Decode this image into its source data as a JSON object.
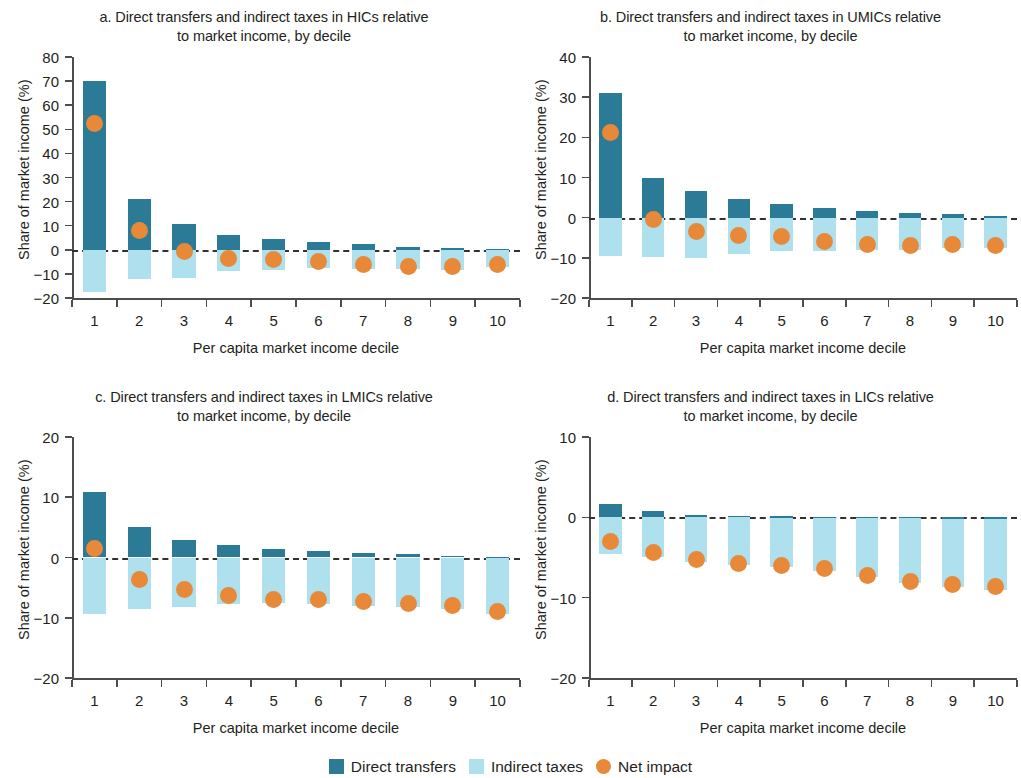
{
  "figure": {
    "x_axis_title": "Per capita market income decile",
    "y_axis_title": "Share of market income (%)"
  },
  "legend": {
    "items": [
      {
        "label": "Direct transfers",
        "shape": "square",
        "color": "#2b7b96",
        "name": "legend-direct-transfers"
      },
      {
        "label": "Indirect taxes",
        "shape": "square",
        "color": "#aee0ee",
        "name": "legend-indirect-taxes"
      },
      {
        "label": "Net impact",
        "shape": "circle",
        "color": "#e8893a",
        "name": "legend-net-impact"
      }
    ]
  },
  "colors": {
    "direct_transfers": "#2b7b96",
    "indirect_taxes": "#aee0ee",
    "net_impact": "#e8893a",
    "axis": "#4d4d4f",
    "zero_line": "#33312f",
    "text": "#231f20"
  },
  "panels": [
    {
      "key": "a",
      "title": "a. Direct transfers and indirect taxes in HICs relative\nto market income, by decile"
    },
    {
      "key": "b",
      "title": "b. Direct transfers and indirect taxes in UMICs relative\nto market income, by decile"
    },
    {
      "key": "c",
      "title": "c. Direct transfers and indirect taxes in LMICs relative\nto market income, by decile"
    },
    {
      "key": "d",
      "title": "d. Direct transfers and indirect taxes in LICs relative\nto market income, by decile"
    }
  ],
  "chart_data": [
    {
      "panel": "a",
      "type": "bar",
      "title": "a. Direct transfers and indirect taxes in HICs relative to market income, by decile",
      "xlabel": "Per capita market income decile",
      "ylabel": "Share of market income (%)",
      "categories": [
        "1",
        "2",
        "3",
        "4",
        "5",
        "6",
        "7",
        "8",
        "9",
        "10"
      ],
      "ylim": [
        -20,
        80
      ],
      "yticks": [
        80,
        70,
        60,
        50,
        40,
        30,
        20,
        10,
        0,
        -10,
        -20
      ],
      "ytick_labels": [
        "80",
        "70",
        "60",
        "50",
        "40",
        "30",
        "20",
        "10",
        "0",
        "−10",
        "−20"
      ],
      "grid": false,
      "zero_line": true,
      "legend_position": "bottom-center-figure",
      "series": [
        {
          "name": "Direct transfers",
          "type": "bar",
          "color": "#2b7b96",
          "values": [
            70.0,
            21.0,
            10.5,
            6.3,
            4.5,
            3.2,
            2.2,
            1.3,
            0.8,
            0.4
          ]
        },
        {
          "name": "Indirect taxes",
          "type": "bar",
          "color": "#aee0ee",
          "values": [
            -17.5,
            -12.0,
            -11.5,
            -8.7,
            -8.5,
            -7.5,
            -7.8,
            -8.0,
            -8.2,
            -7.3
          ]
        },
        {
          "name": "Net impact",
          "type": "scatter",
          "color": "#e8893a",
          "values": [
            52.5,
            8.2,
            -0.8,
            -3.5,
            -4.2,
            -5.0,
            -6.0,
            -6.8,
            -7.0,
            -6.2
          ]
        }
      ]
    },
    {
      "panel": "b",
      "type": "bar",
      "title": "b. Direct transfers and indirect taxes in UMICs relative to market income, by decile",
      "xlabel": "Per capita market income decile",
      "ylabel": "Share of market income (%)",
      "categories": [
        "1",
        "2",
        "3",
        "4",
        "5",
        "6",
        "7",
        "8",
        "9",
        "10"
      ],
      "ylim": [
        -20,
        40
      ],
      "yticks": [
        40,
        30,
        20,
        10,
        0,
        -10,
        -20
      ],
      "ytick_labels": [
        "40",
        "30",
        "20",
        "10",
        "0",
        "−10",
        "−20"
      ],
      "grid": false,
      "zero_line": true,
      "series": [
        {
          "name": "Direct transfers",
          "type": "bar",
          "color": "#2b7b96",
          "values": [
            31.0,
            9.8,
            6.7,
            4.7,
            3.3,
            2.5,
            1.7,
            1.2,
            1.0,
            0.3
          ]
        },
        {
          "name": "Indirect taxes",
          "type": "bar",
          "color": "#aee0ee",
          "values": [
            -9.5,
            -9.8,
            -10.0,
            -9.0,
            -8.3,
            -8.3,
            -8.0,
            -8.0,
            -7.5,
            -7.5
          ]
        },
        {
          "name": "Net impact",
          "type": "scatter",
          "color": "#e8893a",
          "values": [
            21.3,
            -0.4,
            -3.5,
            -4.5,
            -4.8,
            -6.0,
            -6.7,
            -6.9,
            -6.6,
            -7.0
          ]
        }
      ]
    },
    {
      "panel": "c",
      "type": "bar",
      "title": "c. Direct transfers and indirect taxes in LMICs relative to market income, by decile",
      "xlabel": "Per capita market income decile",
      "ylabel": "Share of market income (%)",
      "categories": [
        "1",
        "2",
        "3",
        "4",
        "5",
        "6",
        "7",
        "8",
        "9",
        "10"
      ],
      "ylim": [
        -20,
        20
      ],
      "yticks": [
        20,
        10,
        0,
        -10,
        -20
      ],
      "ytick_labels": [
        "20",
        "10",
        "0",
        "−10",
        "−20"
      ],
      "grid": false,
      "zero_line": true,
      "series": [
        {
          "name": "Direct transfers",
          "type": "bar",
          "color": "#2b7b96",
          "values": [
            10.8,
            5.1,
            2.9,
            2.0,
            1.4,
            1.1,
            0.8,
            0.5,
            0.3,
            0.15
          ]
        },
        {
          "name": "Indirect taxes",
          "type": "bar",
          "color": "#aee0ee",
          "values": [
            -9.3,
            -8.5,
            -8.2,
            -7.8,
            -7.6,
            -7.7,
            -8.0,
            -8.2,
            -8.5,
            -9.3
          ]
        },
        {
          "name": "Net impact",
          "type": "scatter",
          "color": "#e8893a",
          "values": [
            1.5,
            -3.7,
            -5.3,
            -6.3,
            -7.0,
            -7.0,
            -7.3,
            -7.6,
            -8.0,
            -8.9
          ]
        }
      ]
    },
    {
      "panel": "d",
      "type": "bar",
      "title": "d. Direct transfers and indirect taxes in LICs relative to market income, by decile",
      "xlabel": "Per capita market income decile",
      "ylabel": "Share of market income (%)",
      "categories": [
        "1",
        "2",
        "3",
        "4",
        "5",
        "6",
        "7",
        "8",
        "9",
        "10"
      ],
      "ylim": [
        -20,
        10
      ],
      "yticks": [
        10,
        0,
        -10,
        -20
      ],
      "ytick_labels": [
        "10",
        "0",
        "−10",
        "−20"
      ],
      "grid": false,
      "zero_line": true,
      "series": [
        {
          "name": "Direct transfers",
          "type": "bar",
          "color": "#2b7b96",
          "values": [
            1.7,
            0.8,
            0.35,
            0.2,
            0.12,
            0.1,
            0.08,
            0.05,
            0.03,
            0.02
          ]
        },
        {
          "name": "Indirect taxes",
          "type": "bar",
          "color": "#aee0ee",
          "values": [
            -4.6,
            -4.9,
            -5.6,
            -5.9,
            -6.2,
            -6.7,
            -7.4,
            -8.2,
            -8.7,
            -9.0
          ]
        },
        {
          "name": "Net impact",
          "type": "scatter",
          "color": "#e8893a",
          "values": [
            -3.0,
            -4.4,
            -5.2,
            -5.7,
            -6.0,
            -6.4,
            -7.2,
            -8.0,
            -8.4,
            -8.6
          ]
        }
      ]
    }
  ]
}
